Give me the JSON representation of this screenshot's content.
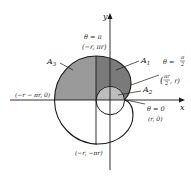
{
  "diagram": {
    "type": "polar spiral area diagram",
    "axes": {
      "x_label": "x",
      "y_label": "y"
    },
    "regions": [
      {
        "id": "A1",
        "label": "A",
        "sub": "1",
        "fill": "#7a7a7a"
      },
      {
        "id": "A2",
        "label": "A",
        "sub": "2",
        "fill": "#bdbdbd"
      },
      {
        "id": "A3",
        "label": "A",
        "sub": "3",
        "fill": "#9a9a9a"
      }
    ],
    "annotations": {
      "theta_pi": "θ = π",
      "point_pi": "(−r, πr)",
      "theta_half_pi_prefix": "θ =",
      "half_pi_num": "π",
      "half_pi_den": "2",
      "point_half_pi_open": "(",
      "point_half_pi_num": "πr",
      "point_half_pi_den": "2",
      "point_half_pi_close": ", r)",
      "theta_zero": "θ = 0",
      "point_zero": "(r, 0)",
      "point_left": "(−r − πr, 0)",
      "point_bottom": "(−r, −πr)"
    },
    "colors": {
      "line": "#1a1a1a",
      "dark_fill": "#7a7a7a",
      "mid_fill": "#9a9a9a",
      "light_fill": "#bdbdbd"
    }
  }
}
